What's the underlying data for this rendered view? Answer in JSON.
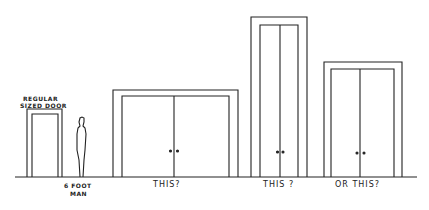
{
  "diagram": {
    "labels": {
      "regular_door_line1": "REGULAR",
      "regular_door_line2": "SIZED DOOR",
      "man_line1": "6 FOOT",
      "man_line2": "MAN",
      "option1": "THIS?",
      "option2": "THIS ?",
      "option3": "OR THIS?"
    },
    "colors": {
      "stroke": "#222222",
      "background": "#ffffff"
    }
  }
}
